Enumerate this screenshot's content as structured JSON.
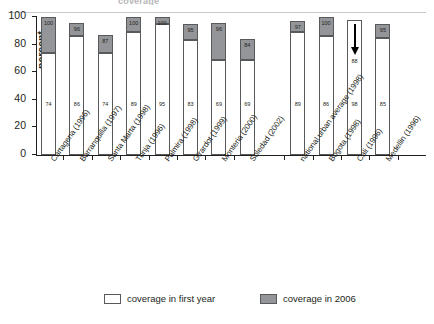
{
  "figure": {
    "title_remnant": "coverage",
    "legend": [
      {
        "label": "coverage in first year",
        "color": "#ffffff",
        "key": "first"
      },
      {
        "label": "coverage in 2006",
        "color": "#939598",
        "key": "later"
      }
    ]
  },
  "chart_data": {
    "type": "bar",
    "subtype": "stacked",
    "title": "",
    "xlabel": "",
    "ylabel": "percent",
    "ylim": [
      0,
      100
    ],
    "yticks": [
      0,
      20,
      40,
      60,
      80,
      100
    ],
    "grid": false,
    "legend_position": "bottom",
    "categories": [
      "Cartagena (1996)",
      "Barranquilla (1997)",
      "Santa Marta (1998)",
      "Tunja (1996)",
      "Palmira (1998)",
      "Girardot (1999)",
      "Monteria (2000)",
      "Soledad (2002)",
      "national urban average (1998)",
      "Bogota (1998)",
      "Cali (1996)",
      "Medellin (1996)"
    ],
    "series": [
      {
        "name": "coverage in first year",
        "color": "#ffffff",
        "values": [
          74,
          86,
          74,
          89,
          95,
          83,
          69,
          69,
          89,
          86,
          98,
          85
        ]
      },
      {
        "name": "coverage in 2006",
        "color": "#939598",
        "values": [
          100,
          96,
          87,
          100,
          100,
          95,
          96,
          84,
          97,
          100,
          88,
          95
        ]
      }
    ],
    "annotations": [
      {
        "category": "Cali (1996)",
        "type": "down-arrow",
        "value": 88,
        "note": "coverage decreased from 98 to 88"
      }
    ],
    "gap_after_category": "Soledad (2002)"
  }
}
